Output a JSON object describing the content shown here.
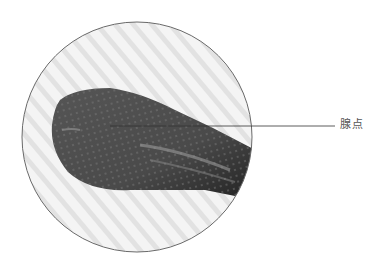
{
  "figure": {
    "annotation_label": "腺点",
    "colors": {
      "background": "#ffffff",
      "circle_border": "#6a6a6a",
      "leaf": "#4a4a4a",
      "leader_line": "#333333",
      "label": "#555555"
    }
  }
}
